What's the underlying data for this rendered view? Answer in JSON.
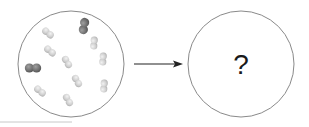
{
  "diagram": {
    "type": "reaction-before-after",
    "left_container": {
      "label": "",
      "cx": 71,
      "cy": 64,
      "r": 53,
      "stroke": "#8a8a8a",
      "molecules": [
        {
          "kind": "diatomic-light",
          "x": 48,
          "y": 33,
          "angle": 40
        },
        {
          "kind": "diatomic-dark",
          "x": 84,
          "y": 26,
          "angle": -80
        },
        {
          "kind": "diatomic-light",
          "x": 94,
          "y": 43,
          "angle": -85
        },
        {
          "kind": "diatomic-light",
          "x": 50,
          "y": 51,
          "angle": 40
        },
        {
          "kind": "diatomic-light",
          "x": 67,
          "y": 62,
          "angle": 60
        },
        {
          "kind": "diatomic-light",
          "x": 103,
          "y": 59,
          "angle": -85
        },
        {
          "kind": "diatomic-dark",
          "x": 33,
          "y": 68,
          "angle": 0
        },
        {
          "kind": "diatomic-light",
          "x": 77,
          "y": 81,
          "angle": 60
        },
        {
          "kind": "diatomic-light",
          "x": 104,
          "y": 86,
          "angle": -85
        },
        {
          "kind": "diatomic-light",
          "x": 40,
          "y": 91,
          "angle": 40
        },
        {
          "kind": "diatomic-light",
          "x": 68,
          "y": 100,
          "angle": 60
        }
      ],
      "colors": {
        "light": "#d4d4d4",
        "light_shade": "#b8b8b8",
        "dark": "#7a7a7a",
        "dark_shade": "#5e5e5e"
      }
    },
    "arrow": {
      "x1": 134,
      "y1": 64,
      "x2": 183,
      "y2": 64,
      "color": "#222222"
    },
    "right_container": {
      "cx": 241,
      "cy": 64,
      "r": 53,
      "stroke": "#8a8a8a",
      "label": "?"
    },
    "baseline": {
      "x1": 0,
      "y1": 122,
      "x2": 72,
      "y2": 122,
      "color": "#c8c8c8"
    }
  }
}
